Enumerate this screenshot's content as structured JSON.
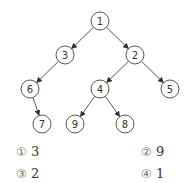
{
  "tree": {
    "nodes": [
      {
        "id": "1",
        "x": 100,
        "y": 21
      },
      {
        "id": "3",
        "x": 65,
        "y": 55
      },
      {
        "id": "2",
        "x": 135,
        "y": 55
      },
      {
        "id": "6",
        "x": 30,
        "y": 89
      },
      {
        "id": "4",
        "x": 100,
        "y": 89
      },
      {
        "id": "5",
        "x": 170,
        "y": 89
      },
      {
        "id": "7",
        "x": 42,
        "y": 124
      },
      {
        "id": "9",
        "x": 75,
        "y": 124
      },
      {
        "id": "8",
        "x": 125,
        "y": 124
      }
    ],
    "edges": [
      [
        "1",
        "3"
      ],
      [
        "1",
        "2"
      ],
      [
        "3",
        "6"
      ],
      [
        "6",
        "7"
      ],
      [
        "2",
        "4"
      ],
      [
        "2",
        "5"
      ],
      [
        "4",
        "9"
      ],
      [
        "4",
        "8"
      ]
    ],
    "node_radius": 9,
    "stroke_color": "#444444"
  },
  "options": [
    {
      "marker": "①",
      "value": "3"
    },
    {
      "marker": "②",
      "value": "9"
    },
    {
      "marker": "③",
      "value": "2"
    },
    {
      "marker": "④",
      "value": "1"
    }
  ]
}
